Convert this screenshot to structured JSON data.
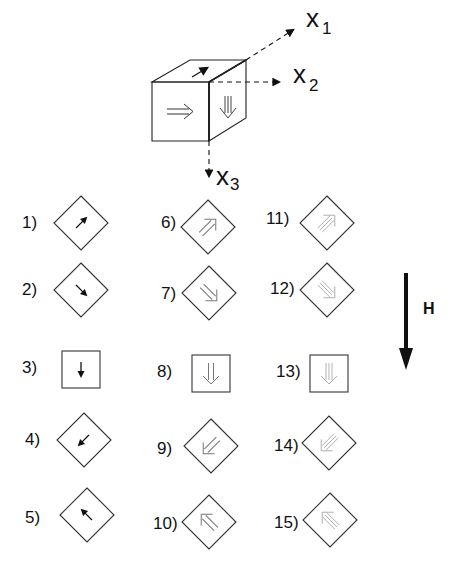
{
  "axes": {
    "x1": {
      "letter": "x",
      "sub": "1"
    },
    "x2": {
      "letter": "x",
      "sub": "2"
    },
    "x3": {
      "letter": "x",
      "sub": "3"
    }
  },
  "field": {
    "label": "H"
  },
  "items": [
    {
      "label": "1)",
      "shape": "diamond",
      "arrow": "single",
      "direction": "up-right",
      "tone": "black"
    },
    {
      "label": "2)",
      "shape": "diamond",
      "arrow": "single",
      "direction": "down-right",
      "tone": "black"
    },
    {
      "label": "3)",
      "shape": "square",
      "arrow": "single",
      "direction": "down",
      "tone": "black"
    },
    {
      "label": "4)",
      "shape": "diamond",
      "arrow": "single",
      "direction": "down-left",
      "tone": "black"
    },
    {
      "label": "5)",
      "shape": "diamond",
      "arrow": "single",
      "direction": "up-left",
      "tone": "black"
    },
    {
      "label": "6)",
      "shape": "diamond",
      "arrow": "double",
      "direction": "up-right",
      "tone": "gray"
    },
    {
      "label": "7)",
      "shape": "diamond",
      "arrow": "double",
      "direction": "down-right",
      "tone": "gray"
    },
    {
      "label": "8)",
      "shape": "square",
      "arrow": "double",
      "direction": "down",
      "tone": "gray"
    },
    {
      "label": "9)",
      "shape": "diamond",
      "arrow": "double",
      "direction": "down-left",
      "tone": "gray"
    },
    {
      "label": "10)",
      "shape": "diamond",
      "arrow": "double",
      "direction": "up-left",
      "tone": "gray"
    },
    {
      "label": "11)",
      "shape": "diamond",
      "arrow": "triple",
      "direction": "up-right",
      "tone": "light-gray"
    },
    {
      "label": "12)",
      "shape": "diamond",
      "arrow": "triple",
      "direction": "down-right",
      "tone": "light-gray"
    },
    {
      "label": "13)",
      "shape": "square",
      "arrow": "triple",
      "direction": "down",
      "tone": "light-gray"
    },
    {
      "label": "14)",
      "shape": "diamond",
      "arrow": "triple",
      "direction": "down-left",
      "tone": "light-gray"
    },
    {
      "label": "15)",
      "shape": "diamond",
      "arrow": "triple",
      "direction": "up-left",
      "tone": "light-gray"
    }
  ],
  "colors": {
    "line": "#333333",
    "black": "#111111",
    "gray": "#777777",
    "light-gray": "#aaaaaa"
  }
}
